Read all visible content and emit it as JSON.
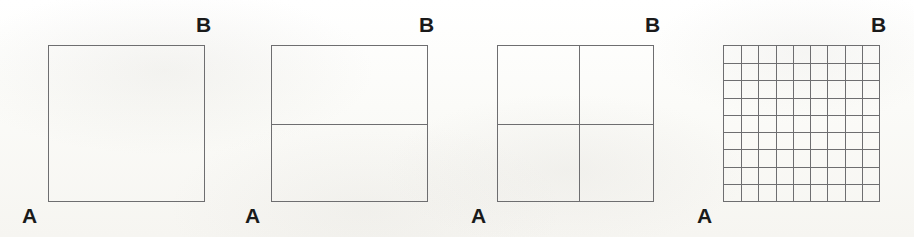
{
  "figure": {
    "background_color": "#fdfdfb",
    "line_color": "#6e6e70",
    "label_color": "#1a1a1a",
    "panel_count": 4,
    "square_size_px": 157,
    "panels": [
      {
        "index": 1,
        "label_a": "A",
        "label_b": "B",
        "columns": 1,
        "rows": 1,
        "subdivision": "undivided square",
        "offset_x": 0,
        "vertical_lines": [],
        "horizontal_lines": []
      },
      {
        "index": 2,
        "label_a": "A",
        "label_b": "B",
        "columns": 1,
        "rows": 2,
        "subdivision": "two horizontal strips",
        "offset_x": 223,
        "vertical_lines": [],
        "horizontal_lines": [
          50
        ]
      },
      {
        "index": 3,
        "label_a": "A",
        "label_b": "B",
        "columns": 2,
        "rows": 2,
        "subdivision": "two by two quadrants",
        "offset_x": 449,
        "vertical_lines": [
          52
        ],
        "horizontal_lines": [
          50
        ]
      },
      {
        "index": 4,
        "label_a": "A",
        "label_b": "B",
        "columns": 9,
        "rows": 9,
        "subdivision": "nine by nine grid",
        "offset_x": 675,
        "vertical_lines": [],
        "horizontal_lines": []
      }
    ]
  }
}
